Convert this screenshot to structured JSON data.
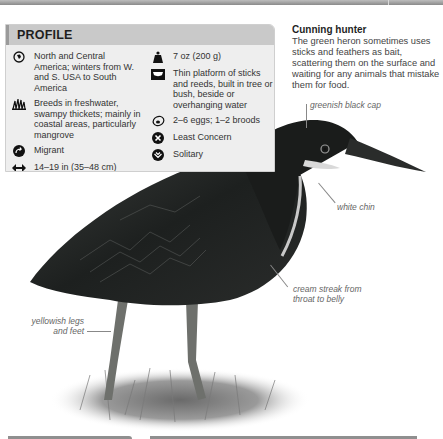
{
  "profile": {
    "title": "PROFILE",
    "left": [
      {
        "icon": "globe-range-icon",
        "text": "North and Central America; winters from W. and S. USA to South America"
      },
      {
        "icon": "reeds-habitat-icon",
        "text": "Breeds in freshwater, swampy thickets; mainly in coastal areas, particularly mangrove"
      },
      {
        "icon": "migration-arrow-icon",
        "text": "Migrant"
      },
      {
        "icon": "length-arrows-icon",
        "text": "14–19 in (35–48 cm)"
      }
    ],
    "right": [
      {
        "icon": "weight-icon",
        "text": "7 oz (200 g)"
      },
      {
        "icon": "nest-icon",
        "text": "Thin platform of sticks and reeds, built in tree or bush, beside or overhanging water"
      },
      {
        "icon": "egg-icon",
        "text": "2–6 eggs; 1–2 broods"
      },
      {
        "icon": "conservation-status-icon",
        "text": "Least Concern"
      },
      {
        "icon": "social-behavior-icon",
        "text": "Solitary"
      }
    ]
  },
  "side_note": {
    "title": "Cunning hunter",
    "body": "The green heron sometimes uses sticks and feathers as bait, scattering them on the surface and waiting for any animals that mistake them for food."
  },
  "callouts": {
    "cap": "greenish black cap",
    "chin": "white chin",
    "streak": "cream streak from throat to belly",
    "legs": "yellowish legs and feet"
  },
  "colors": {
    "panel_bg": "#eeeeee",
    "panel_header": "#c9c9c9",
    "bird_dark": "#1c1f1e"
  }
}
